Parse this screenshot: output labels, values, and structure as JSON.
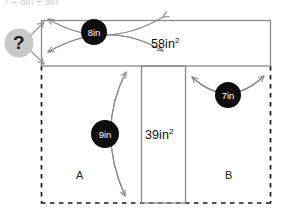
{
  "figure": {
    "title_strip": "? = 8in + 9in",
    "unknown_marker": {
      "symbol": "?",
      "fill_color": "#c9c9c9",
      "text_color": "#1a1a1a"
    },
    "measurements": [
      {
        "name": "top-width",
        "label": "8in",
        "value": 8,
        "unit": "in"
      },
      {
        "name": "left-height",
        "label": "9in",
        "value": 9,
        "unit": "in"
      },
      {
        "name": "right-width",
        "label": "7in",
        "value": 7,
        "unit": "in"
      }
    ],
    "areas": [
      {
        "name": "top-area",
        "label": "58in",
        "exponent": "2",
        "value": 58,
        "unit": "in2"
      },
      {
        "name": "middle-area",
        "label": "39in",
        "exponent": "2",
        "value": 39,
        "unit": "in2"
      }
    ],
    "regions": [
      {
        "name": "region-a",
        "label": "A"
      },
      {
        "name": "region-b",
        "label": "B"
      }
    ],
    "colors": {
      "bubble_fill": "#0d0d0d",
      "bubble_text": "#ffffff",
      "solid_line": "#808080",
      "dashed_line": "#1a1a1a",
      "arrow_line": "#8a8a8a",
      "background": "#ffffff"
    }
  }
}
